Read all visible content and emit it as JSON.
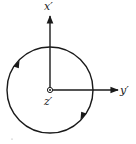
{
  "diagram": {
    "labels": {
      "x_axis": "x′",
      "y_axis": "y′",
      "z_axis": "z′"
    },
    "circle": {
      "direction": "clockwise",
      "arrow_count": 2
    },
    "z_axis_symbol": "dot-in-circle (out of page)",
    "colors": {
      "ink": "#1a1a1a",
      "background": "#ffffff"
    }
  }
}
